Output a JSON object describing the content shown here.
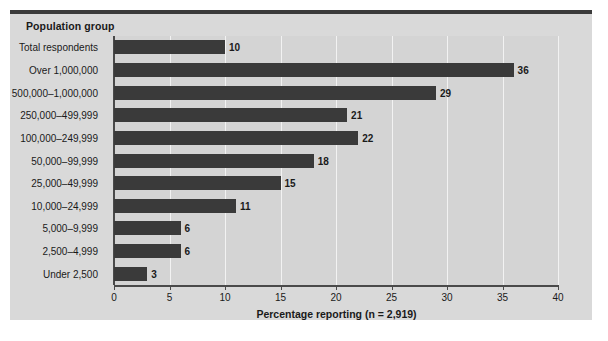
{
  "header": {
    "title": "Population group"
  },
  "chart_data": {
    "type": "bar",
    "orientation": "horizontal",
    "title": "",
    "subtitle": "",
    "xlabel": "Percentage reporting (n = 2,919)",
    "ylabel": "Population group",
    "categories": [
      "Total respondents",
      "Over 1,000,000",
      "500,000–1,000,000",
      "250,000–499,999",
      "100,000–249,999",
      "50,000–99,999",
      "25,000–49,999",
      "10,000–24,999",
      "5,000–9,999",
      "2,500–4,999",
      "Under 2,500"
    ],
    "values": [
      10,
      36,
      29,
      21,
      22,
      18,
      15,
      11,
      6,
      6,
      3
    ],
    "value_labels": [
      "10",
      "36",
      "29",
      "21",
      "22",
      "18",
      "15",
      "11",
      "6",
      "6",
      "3"
    ],
    "xticks": [
      0,
      5,
      10,
      15,
      20,
      25,
      30,
      35,
      40
    ],
    "xtick_labels": [
      "0",
      "5",
      "10",
      "15",
      "20",
      "25",
      "30",
      "35",
      "40"
    ],
    "xlim": [
      0,
      40
    ],
    "grid": "vertical",
    "legend": "none",
    "colors": {
      "bar": "#3a3a3a",
      "plot_background": "#d4d4d4",
      "panel_background": "#d9d9d9",
      "gridline": "#f2f2f2",
      "axis": "#4a4a4a",
      "text": "#1a1a1a",
      "top_rule": "#3b3b3b"
    }
  }
}
